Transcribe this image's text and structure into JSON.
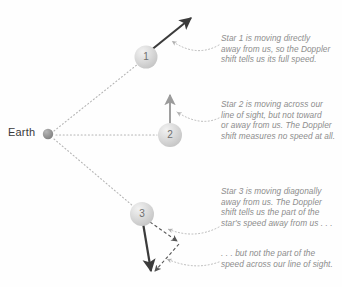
{
  "figure": {
    "background_color": "#fefefe",
    "width": 342,
    "height": 287
  },
  "observer": {
    "label": "Earth",
    "dot_color": "#9a9a9a",
    "position": {
      "x": 48,
      "y": 134
    }
  },
  "stars": [
    {
      "id": "star-1",
      "label": "1",
      "center": {
        "x": 146,
        "y": 57
      },
      "radius": 11,
      "fill_color": "#dcdcdc",
      "velocity_arrow": {
        "kind": "solid",
        "from": {
          "x": 150,
          "y": 51
        },
        "to": {
          "x": 193,
          "y": 16
        },
        "color": "#3b3b3b"
      }
    },
    {
      "id": "star-2",
      "label": "2",
      "center": {
        "x": 170,
        "y": 135
      },
      "radius": 12,
      "fill_color": "#dcdcdc",
      "velocity_arrow": {
        "kind": "solid",
        "from": {
          "x": 170,
          "y": 124
        },
        "to": {
          "x": 170,
          "y": 92
        },
        "color": "#9b9b9b"
      }
    },
    {
      "id": "star-3",
      "label": "3",
      "center": {
        "x": 142,
        "y": 214
      },
      "radius": 12,
      "fill_color": "#dcdcdc",
      "velocity_arrow": {
        "kind": "solid",
        "from": {
          "x": 143,
          "y": 224
        },
        "to": {
          "x": 152,
          "y": 274
        },
        "color": "#3b3b3b"
      },
      "component_arrows": [
        {
          "name": "radial-component",
          "kind": "dashed",
          "from": {
            "x": 150,
            "y": 222
          },
          "to": {
            "x": 179,
            "y": 243
          },
          "color": "#555555"
        },
        {
          "name": "transverse-component",
          "kind": "dashed",
          "from": {
            "x": 179,
            "y": 243
          },
          "to": {
            "x": 154,
            "y": 272
          },
          "color": "#555555"
        }
      ]
    }
  ],
  "sight_lines": [
    {
      "name": "line-of-sight-star-1",
      "from": {
        "x": 54,
        "y": 131
      },
      "to": {
        "x": 138,
        "y": 64
      }
    },
    {
      "name": "line-of-sight-star-2",
      "from": {
        "x": 56,
        "y": 135
      },
      "to": {
        "x": 157,
        "y": 135
      }
    },
    {
      "name": "line-of-sight-star-3",
      "from": {
        "x": 54,
        "y": 139
      },
      "to": {
        "x": 133,
        "y": 206
      }
    }
  ],
  "callouts": [
    {
      "id": "callout-1",
      "text": "Star 1 is moving directly\naway from us, so the Doppler\nshift tells us its full speed.",
      "leader": {
        "from": {
          "x": 219,
          "y": 45
        },
        "control": {
          "x": 196,
          "y": 57
        },
        "to": {
          "x": 170,
          "y": 40
        }
      }
    },
    {
      "id": "callout-2",
      "text": "Star 2 is moving across our\nline of sight, but not toward\nor away from us. The Doppler\nshift measures no speed at all.",
      "leader": {
        "from": {
          "x": 219,
          "y": 118
        },
        "control": {
          "x": 200,
          "y": 126
        },
        "to": {
          "x": 175,
          "y": 111
        }
      }
    },
    {
      "id": "callout-3",
      "text": "Star 3 is moving diagonally\naway from us. The Doppler\nshift tells us the part of the\nstar's speed away from us . . .",
      "leader": {
        "from": {
          "x": 219,
          "y": 227
        },
        "control": {
          "x": 196,
          "y": 238
        },
        "to": {
          "x": 166,
          "y": 228
        }
      }
    },
    {
      "id": "callout-4",
      "text": ". . . but not the part of the\nspeed across our line of sight.",
      "leader": {
        "from": {
          "x": 219,
          "y": 262
        },
        "control": {
          "x": 196,
          "y": 270
        },
        "to": {
          "x": 165,
          "y": 258
        }
      }
    }
  ],
  "colors": {
    "text_gray": "#8d8d8d",
    "label_dark": "#3a3a3a",
    "arrow_dark": "#3b3b3b",
    "arrow_light": "#9b9b9b",
    "sphere_fill": "#dcdcdc",
    "dotted_line": "#b4b4b4"
  }
}
